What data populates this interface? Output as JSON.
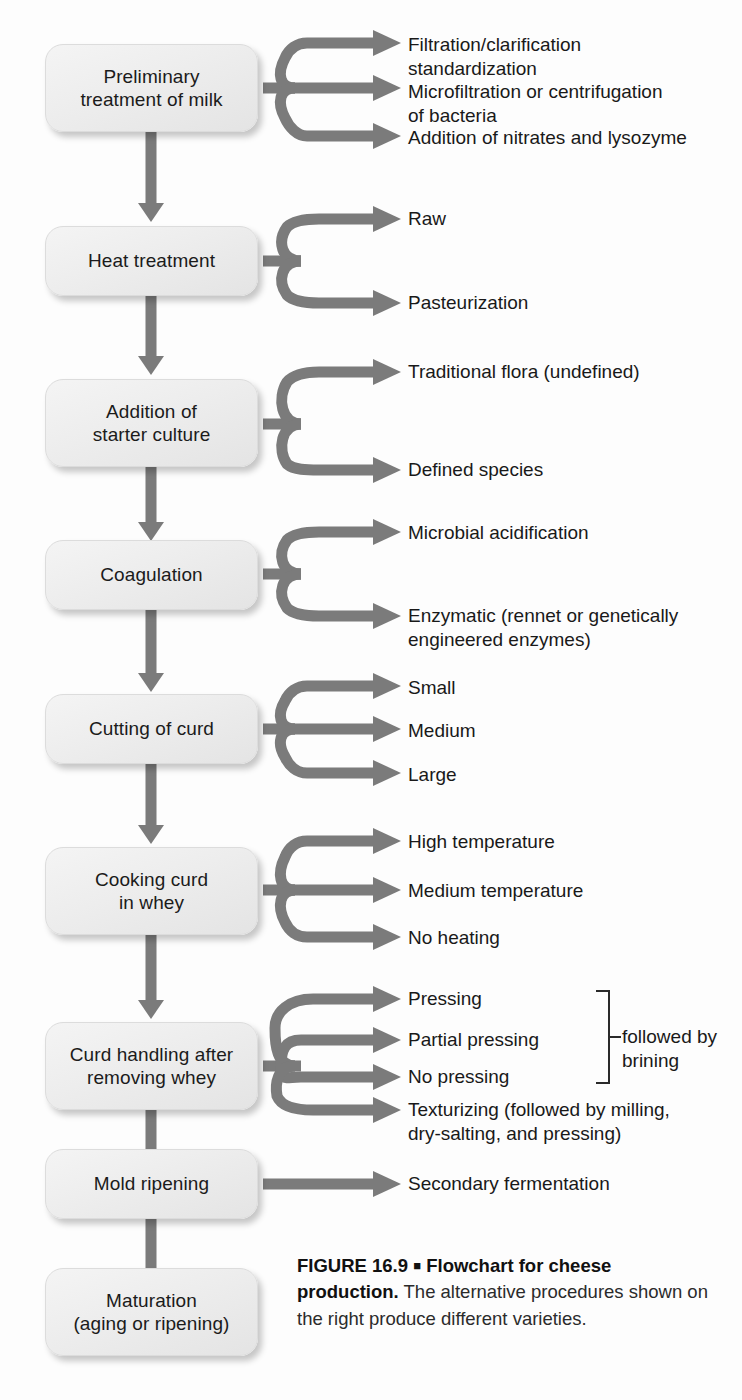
{
  "figure": {
    "label": "FIGURE 16.9",
    "separator": "■",
    "title": "Flowchart for cheese production.",
    "description": " The alternative procedures shown on the right produce different varieties."
  },
  "colors": {
    "arrow": "#7b7b7b",
    "box_fill": "#ededed",
    "text": "#191919",
    "bracket": "#2a2a2a"
  },
  "steps": [
    {
      "id": "preliminary-treatment",
      "label": "Preliminary\ntreatment of milk"
    },
    {
      "id": "heat-treatment",
      "label": "Heat treatment"
    },
    {
      "id": "starter-culture",
      "label": "Addition of\nstarter culture"
    },
    {
      "id": "coagulation",
      "label": "Coagulation"
    },
    {
      "id": "cutting-of-curd",
      "label": "Cutting of curd"
    },
    {
      "id": "cooking-curd",
      "label": "Cooking curd\nin whey"
    },
    {
      "id": "curd-handling",
      "label": "Curd handling after\nremoving whey"
    },
    {
      "id": "mold-ripening",
      "label": "Mold ripening"
    },
    {
      "id": "maturation",
      "label": "Maturation\n(aging or ripening)"
    }
  ],
  "branches": [
    {
      "step": "preliminary-treatment",
      "options": [
        "Filtration/clarification\nstandardization",
        "Microfiltration or centrifugation\nof bacteria",
        "Addition of nitrates and lysozyme"
      ]
    },
    {
      "step": "heat-treatment",
      "options": [
        "Raw",
        "Pasteurization"
      ]
    },
    {
      "step": "starter-culture",
      "options": [
        "Traditional flora (undefined)",
        "Defined species"
      ]
    },
    {
      "step": "coagulation",
      "options": [
        "Microbial acidification",
        "Enzymatic (rennet or genetically\nengineered enzymes)"
      ]
    },
    {
      "step": "cutting-of-curd",
      "options": [
        "Small",
        "Medium",
        "Large"
      ]
    },
    {
      "step": "cooking-curd",
      "options": [
        "High temperature",
        "Medium temperature",
        "No heating"
      ]
    },
    {
      "step": "curd-handling",
      "options": [
        "Pressing",
        "Partial pressing",
        "No pressing",
        "Texturizing (followed by milling,\ndry-salting, and pressing)"
      ],
      "bracket_note": "followed by\nbrining"
    },
    {
      "step": "mold-ripening",
      "options": [
        "Secondary fermentation"
      ]
    }
  ]
}
